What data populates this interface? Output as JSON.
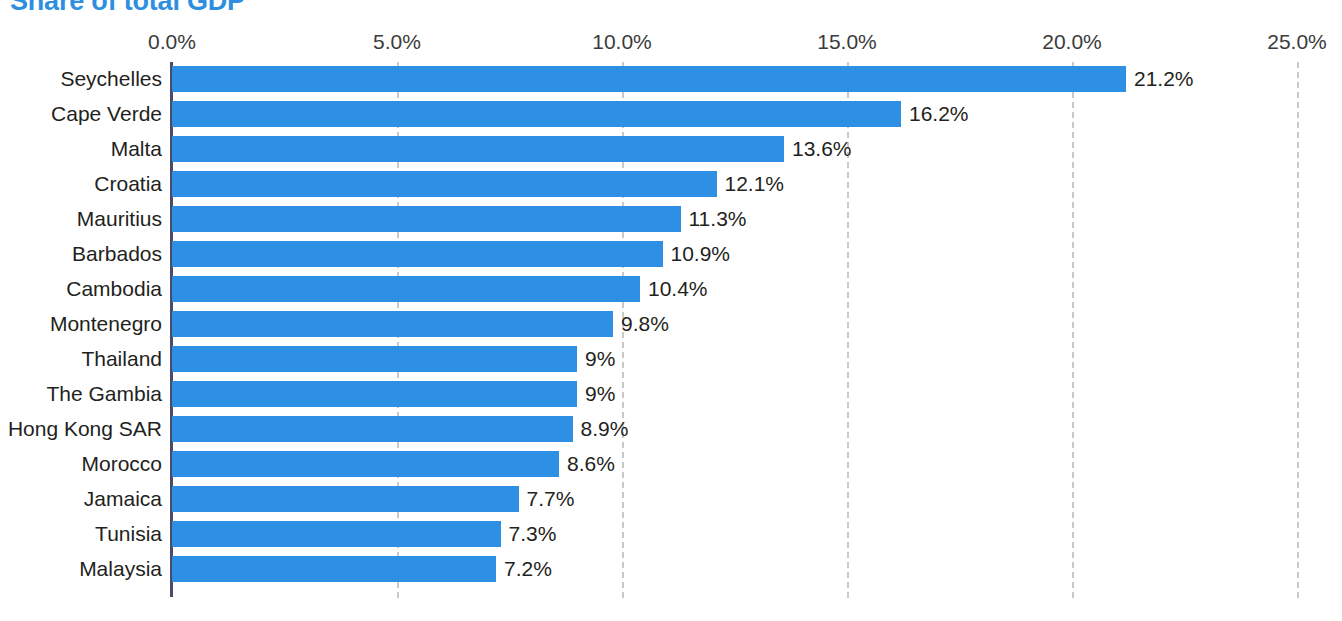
{
  "chart_data": {
    "type": "bar",
    "orientation": "horizontal",
    "title": "Share of total GDP",
    "xlabel": "",
    "ylabel": "",
    "xlim": [
      0,
      25
    ],
    "xticks": [
      0,
      5,
      10,
      15,
      20,
      25
    ],
    "xtick_labels": [
      "0.0%",
      "5.0%",
      "10.0%",
      "15.0%",
      "20.0%",
      "25.0%"
    ],
    "grid": true,
    "grid_axis": "x",
    "legend": false,
    "axis_position": "top",
    "bar_color": "#2e90e5",
    "title_color": "#2e8fe0",
    "categories": [
      "Seychelles",
      "Cape Verde",
      "Malta",
      "Croatia",
      "Mauritius",
      "Barbados",
      "Cambodia",
      "Montenegro",
      "Thailand",
      "The Gambia",
      "Hong Kong SAR",
      "Morocco",
      "Jamaica",
      "Tunisia",
      "Malaysia"
    ],
    "values": [
      21.2,
      16.2,
      13.6,
      12.1,
      11.3,
      10.9,
      10.4,
      9.8,
      9.0,
      9.0,
      8.9,
      8.6,
      7.7,
      7.3,
      7.2
    ],
    "value_labels": [
      "21.2%",
      "16.2%",
      "13.6%",
      "12.1%",
      "11.3%",
      "10.9%",
      "10.4%",
      "9.8%",
      "9%",
      "9%",
      "8.9%",
      "8.6%",
      "7.7%",
      "7.3%",
      "7.2%"
    ]
  }
}
